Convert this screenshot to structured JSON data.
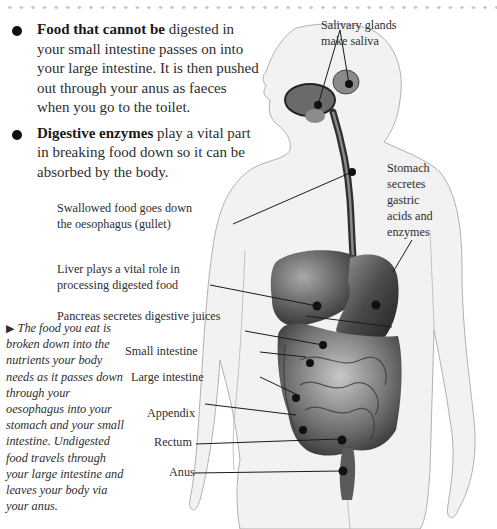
{
  "bullets": [
    {
      "bold": "Food that cannot be",
      "text": " digested in your small intestine passes on into your large intestine. It is then pushed out through your anus as faeces when you go to the toilet."
    },
    {
      "bold": "Digestive enzymes",
      "text": " play a vital part in breaking food down so it can be absorbed by the body."
    }
  ],
  "labels": {
    "salivary_1": "Salivary glands",
    "salivary_2": "make saliva",
    "oesophagus_1": "Swallowed food goes down",
    "oesophagus_2": "the oesophagus (gullet)",
    "liver_1": "Liver plays a vital role in",
    "liver_2": "processing digested food",
    "pancreas": "Pancreas secretes digestive juices",
    "small_intestine": "Small intestine",
    "large_intestine": "Large intestine",
    "appendix": "Appendix",
    "rectum": "Rectum",
    "anus": "Anus",
    "stomach_1": "Stomach",
    "stomach_2": "secretes",
    "stomach_3": "gastric",
    "stomach_4": "acids and",
    "stomach_5": "enzymes"
  },
  "caption": {
    "arrow": "▶",
    "text": " The food you eat is broken down into the nutrients your body needs as it passes down through your oesophagus into your stomach and your small intestine. Undigested food travels through your large intestine and leaves your body via your anus."
  },
  "colors": {
    "body_fill": "#f1f1f1",
    "body_outline": "#a9a9a9",
    "organ_dark": "#2b2b2b",
    "organ_mid": "#7a7a7a",
    "dot_border": "#c9c9c9"
  }
}
